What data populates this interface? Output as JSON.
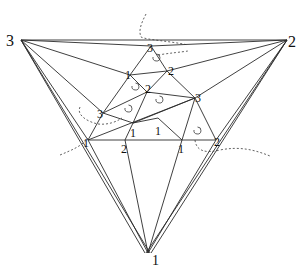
{
  "diagram": {
    "type": "triangulation",
    "outer_labels": {
      "left": "3",
      "right": "2",
      "bottom": "1"
    },
    "inner_labels": [
      {
        "id": "top",
        "text": "3"
      },
      {
        "id": "upper_left",
        "text": "1"
      },
      {
        "id": "upper_right",
        "text": "2"
      },
      {
        "id": "mid_center",
        "text": "2"
      },
      {
        "id": "mid_right",
        "text": "3"
      },
      {
        "id": "mid_left",
        "text": "3"
      },
      {
        "id": "center_left",
        "text": "1"
      },
      {
        "id": "center_right",
        "text": "1"
      },
      {
        "id": "base_left",
        "text": "1"
      },
      {
        "id": "base_mid_left",
        "text": "2"
      },
      {
        "id": "base_mid_right",
        "text": "1"
      },
      {
        "id": "base_right",
        "text": "2"
      }
    ],
    "orientation_symbol": "counterclockwise-circle-arrow",
    "colors": {
      "line": "#2a2a2a",
      "background": "#ffffff"
    }
  }
}
